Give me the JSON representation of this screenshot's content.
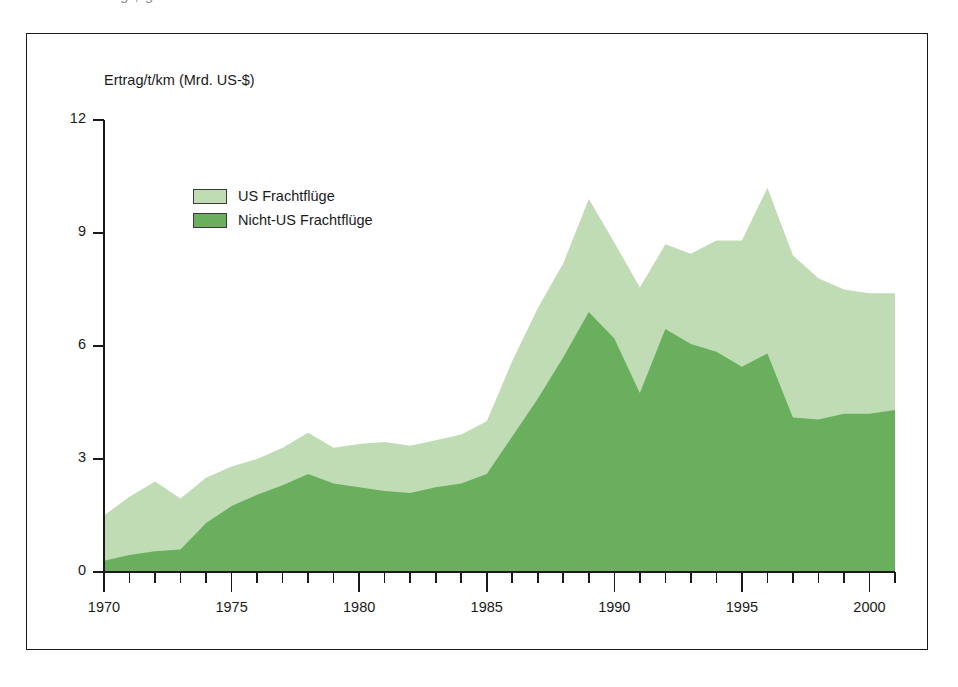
{
  "figure": {
    "scan_artifact_text": "g , g",
    "background_color": "#ffffff",
    "frame_color": "#1a1a1a"
  },
  "chart_data": {
    "type": "area",
    "stacked": true,
    "title": "",
    "subtitle": "",
    "xlabel": "",
    "ylabel": "Ertrag/t/km (Mrd. US-$)",
    "axis_label_position": "above-axis",
    "grid": false,
    "legend_position": "inside-upper-left",
    "xlim": [
      1970,
      2001
    ],
    "ylim": [
      0,
      12
    ],
    "ytick_values": [
      0,
      3,
      6,
      9,
      12
    ],
    "ytick_labels": [
      "0",
      "3",
      "6",
      "9",
      "12"
    ],
    "xtick_major_values": [
      1970,
      1975,
      1980,
      1985,
      1990,
      1995,
      2000
    ],
    "xtick_major_labels": [
      "1970",
      "1975",
      "1980",
      "1985",
      "1990",
      "1995",
      "2000"
    ],
    "xtick_minor_step": 1,
    "x": [
      1970,
      1971,
      1972,
      1973,
      1974,
      1975,
      1976,
      1977,
      1978,
      1979,
      1980,
      1981,
      1982,
      1983,
      1984,
      1985,
      1986,
      1987,
      1988,
      1989,
      1990,
      1991,
      1992,
      1993,
      1994,
      1995,
      1996,
      1997,
      1998,
      1999,
      2000,
      2001
    ],
    "colors": {
      "us_frachtfluege": "#bfdcb4",
      "nicht_us_frachtfluege": "#6aaf5e",
      "series_outline": "none"
    },
    "series": [
      {
        "name": "Nicht-US Frachtflüge",
        "color": "#6aaf5e",
        "stack_order": 1,
        "values": [
          0.3,
          0.45,
          0.55,
          0.6,
          1.3,
          1.75,
          2.05,
          2.3,
          2.6,
          2.35,
          2.25,
          2.15,
          2.1,
          2.25,
          2.35,
          2.6,
          3.6,
          4.6,
          5.7,
          6.9,
          6.2,
          4.75,
          6.45,
          6.05,
          5.85,
          5.45,
          5.8,
          4.1,
          4.05,
          4.2,
          4.2,
          4.3
        ]
      },
      {
        "name": "US Frachtflüge",
        "color": "#bfdcb4",
        "stack_order": 2,
        "values": [
          1.2,
          1.55,
          1.85,
          1.35,
          1.2,
          1.05,
          0.95,
          1.0,
          1.1,
          0.95,
          1.15,
          1.3,
          1.25,
          1.25,
          1.3,
          1.4,
          2.0,
          2.4,
          2.5,
          3.0,
          2.55,
          2.8,
          2.25,
          2.4,
          2.95,
          3.35,
          4.4,
          4.3,
          3.75,
          3.3,
          3.2,
          3.1
        ]
      }
    ],
    "totals": [
      1.5,
      2.0,
      2.4,
      1.95,
      2.5,
      2.8,
      3.0,
      3.3,
      3.7,
      3.3,
      3.4,
      3.45,
      3.35,
      3.5,
      3.65,
      4.0,
      5.6,
      7.0,
      8.2,
      9.9,
      8.75,
      7.55,
      8.7,
      8.45,
      8.8,
      8.8,
      10.2,
      8.4,
      7.8,
      7.5,
      7.4,
      7.4
    ],
    "annotations": []
  },
  "legend": {
    "items": [
      {
        "label": "US Frachtflüge",
        "color": "#bfdcb4"
      },
      {
        "label": "Nicht-US Frachtflüge",
        "color": "#6aaf5e"
      }
    ]
  }
}
